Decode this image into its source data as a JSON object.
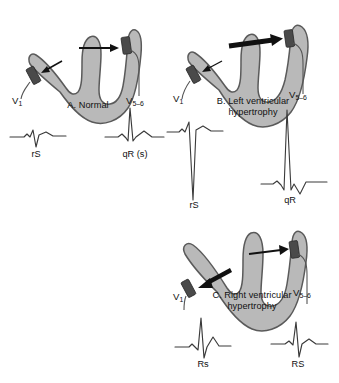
{
  "figure": {
    "background_color": "#ffffff",
    "heart_fill_color": "#b9b9b9",
    "heart_stroke_color": "#5a5a5a",
    "electrode_color": "#4a4a4a",
    "arrow_color": "#111111",
    "trace_color": "#3a3a3a"
  },
  "panels": [
    {
      "id": "A",
      "caption": "A. Normal",
      "leads": [
        {
          "name": "V1",
          "label": "V",
          "sub": "1"
        },
        {
          "name": "V5-6",
          "label": "V",
          "sub": "5–6"
        }
      ],
      "waveforms": [
        {
          "lead": "V1",
          "label": "rS",
          "morphology": "small r, deep S",
          "r_amplitude": 6,
          "s_amplitude": -10
        },
        {
          "lead": "V5-6",
          "label": "qR (s)",
          "morphology": "small q, tall R, small s",
          "q_amplitude": -3,
          "r_amplitude": 34,
          "s_amplitude": -4
        }
      ],
      "vectors": [
        {
          "name": "left-ventricular-vector",
          "direction": "rightward",
          "weight": "thin"
        },
        {
          "name": "right-ventricular-vector",
          "direction": "leftward",
          "weight": "thin"
        }
      ]
    },
    {
      "id": "B",
      "caption": "B. Left ventricular\nhypertrophy",
      "leads": [
        {
          "name": "V1",
          "label": "V",
          "sub": "1"
        },
        {
          "name": "V5-6",
          "label": "V",
          "sub": "5–6"
        }
      ],
      "waveforms": [
        {
          "lead": "V1",
          "label": "rS",
          "morphology": "small r, very deep S",
          "r_amplitude": 7,
          "s_amplitude": -72
        },
        {
          "lead": "V5-6",
          "label": "qR",
          "morphology": "small q, very tall R",
          "q_amplitude": -4,
          "r_amplitude": 72,
          "s_amplitude": -6
        }
      ],
      "vectors": [
        {
          "name": "left-ventricular-vector",
          "direction": "rightward",
          "weight": "bold"
        },
        {
          "name": "right-ventricular-vector",
          "direction": "leftward",
          "weight": "thin"
        }
      ]
    },
    {
      "id": "C",
      "caption": "C. Right ventricular\nhypertrophy",
      "leads": [
        {
          "name": "V1",
          "label": "V",
          "sub": "1"
        },
        {
          "name": "V5-6",
          "label": "V",
          "sub": "5–6"
        }
      ],
      "waveforms": [
        {
          "lead": "V1",
          "label": "Rs",
          "morphology": "tall R, small s",
          "r_amplitude": 32,
          "s_amplitude": -8
        },
        {
          "lead": "V5-6",
          "label": "RS",
          "morphology": "small R, deep S",
          "r_amplitude": 24,
          "s_amplitude": -9
        }
      ],
      "vectors": [
        {
          "name": "right-ventricular-vector",
          "direction": "leftward",
          "weight": "bold"
        },
        {
          "name": "left-ventricular-vector",
          "direction": "rightward",
          "weight": "thin"
        }
      ]
    }
  ]
}
